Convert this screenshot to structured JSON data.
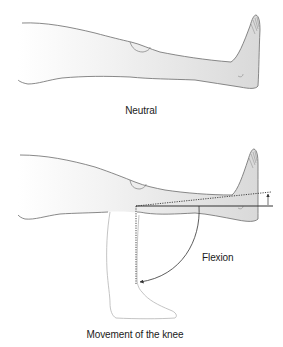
{
  "figure": {
    "panels": [
      {
        "id": "neutral",
        "caption": "Neutral"
      },
      {
        "id": "flexion",
        "caption": "Movement of the knee",
        "annotations": {
          "movement_label": "Flexion"
        }
      }
    ],
    "colors": {
      "outline": "#6b6b6b",
      "ghost_outline": "#b5b5b5",
      "skin_fill_light": "#ffffff",
      "skin_fill_dark": "#dcdcdc",
      "reference_line": "#333333",
      "text": "#1a1a1a"
    }
  }
}
